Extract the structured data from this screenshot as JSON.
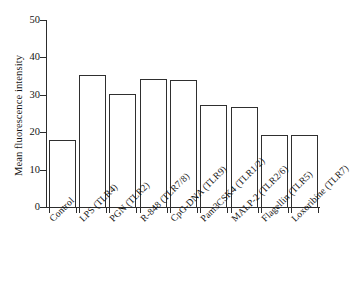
{
  "chart_data": {
    "type": "bar",
    "title": "",
    "xlabel": "",
    "ylabel": "Mean fluorescence intensity",
    "ylim": [
      0,
      50
    ],
    "yticks": [
      0,
      10,
      20,
      30,
      40,
      50
    ],
    "grid": false,
    "legend": null,
    "categories": [
      "Control",
      "LPS (TLR4)",
      "PGN (TLR2)",
      "R-848 (TLR7/8)",
      "CpG-DNA (TLR9)",
      "Pam3CSK4 (TLR1/2)",
      "MALP-2 (TLR2/6)",
      "Flagellin (TLR5)",
      "Loxoribine (TLR7)"
    ],
    "values": [
      17.8,
      35.2,
      30.3,
      34.3,
      33.9,
      27.4,
      26.8,
      19.3,
      19.3
    ],
    "bar_fill_color": "#ffffff",
    "bar_edge_color": "#2f2f2f",
    "axis_color": "#2c2c2c"
  }
}
